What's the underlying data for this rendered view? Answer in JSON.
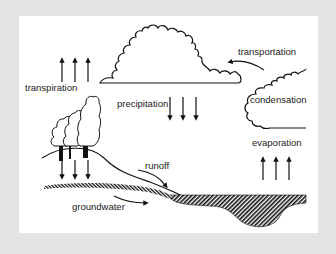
{
  "diagram": {
    "background_color": "#e4e4e4",
    "panel_color": "#ffffff",
    "ink_color": "#111111",
    "labels": {
      "transpiration": "transpiration",
      "precipitation": "precipitation",
      "transportation": "transportation",
      "condensation": "condensation",
      "evaporation": "evaporation",
      "runoff": "runoff",
      "groundwater": "groundwater"
    },
    "elements": [
      {
        "name": "cloud-large",
        "type": "cloud"
      },
      {
        "name": "cloud-condensation",
        "type": "cloud"
      },
      {
        "name": "trees",
        "type": "tree-group",
        "count": 3
      },
      {
        "name": "hill",
        "type": "terrain"
      },
      {
        "name": "groundwater-layer",
        "type": "hatched-band"
      },
      {
        "name": "water-body",
        "type": "hatched-basin"
      },
      {
        "name": "transpiration-arrows",
        "type": "arrow-group",
        "direction": "up",
        "count": 3
      },
      {
        "name": "precipitation-arrows",
        "type": "arrow-group",
        "direction": "down",
        "count": 3
      },
      {
        "name": "infiltration-arrows",
        "type": "arrow-group",
        "direction": "down",
        "count": 3
      },
      {
        "name": "evaporation-arrows",
        "type": "arrow-group",
        "direction": "up",
        "count": 3
      },
      {
        "name": "transportation-arrow",
        "type": "curved-arrow",
        "direction": "left"
      },
      {
        "name": "runoff-arrow",
        "type": "curved-arrow",
        "direction": "down-right"
      },
      {
        "name": "groundwater-arrow",
        "type": "curved-arrow",
        "direction": "right"
      }
    ]
  }
}
